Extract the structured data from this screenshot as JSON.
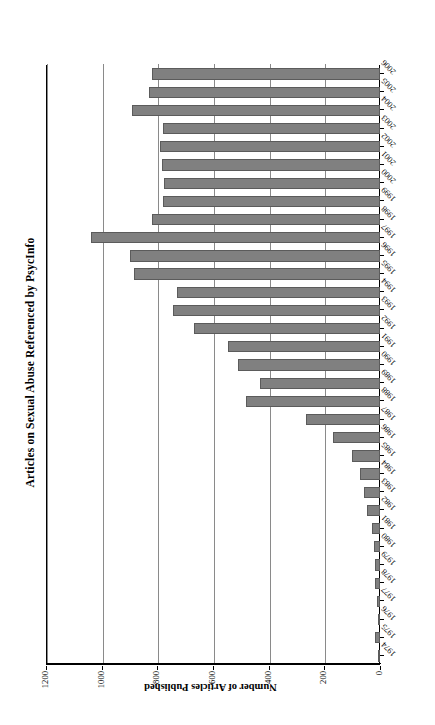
{
  "figure": {
    "title": "Articles on Sexual Abuse Referenced by PsycInfo",
    "value_axis_title": "Number of Articles Published",
    "category_axis_title": "Publication Year",
    "bar_color": "#808080",
    "bar_border_color": "#5b5b5b",
    "grid_color": "#8a8a8a",
    "axis_color": "#000000",
    "orientation_note": "printed sideways (rotated 90 degrees)"
  },
  "chart_data": {
    "type": "bar",
    "title": "Articles on Sexual Abuse Referenced by PsycInfo",
    "xlabel": "Publication Year",
    "ylabel": "Number of Articles Published",
    "ylim": [
      0,
      1200
    ],
    "yticks": [
      0,
      200,
      400,
      600,
      800,
      1000,
      1200
    ],
    "ytick_labels": [
      "0",
      "200",
      "400",
      "600",
      "800",
      "1000",
      "1200"
    ],
    "grid": true,
    "legend": false,
    "categories": [
      "1974",
      "1975",
      "1976",
      "1977",
      "1978",
      "1979",
      "1980",
      "1981",
      "1982",
      "1983",
      "1984",
      "1985",
      "1986",
      "1987",
      "1988",
      "1989",
      "1990",
      "1991",
      "1992",
      "1993",
      "1994",
      "1995",
      "1996",
      "1997",
      "1998",
      "1999",
      "2000",
      "2001",
      "2002",
      "2003",
      "2004",
      "2005",
      "2006"
    ],
    "values": [
      4,
      18,
      8,
      12,
      18,
      18,
      22,
      30,
      45,
      57,
      72,
      100,
      170,
      265,
      480,
      430,
      510,
      545,
      670,
      745,
      730,
      885,
      900,
      1040,
      820,
      780,
      775,
      785,
      790,
      780,
      890,
      830,
      820
    ]
  }
}
